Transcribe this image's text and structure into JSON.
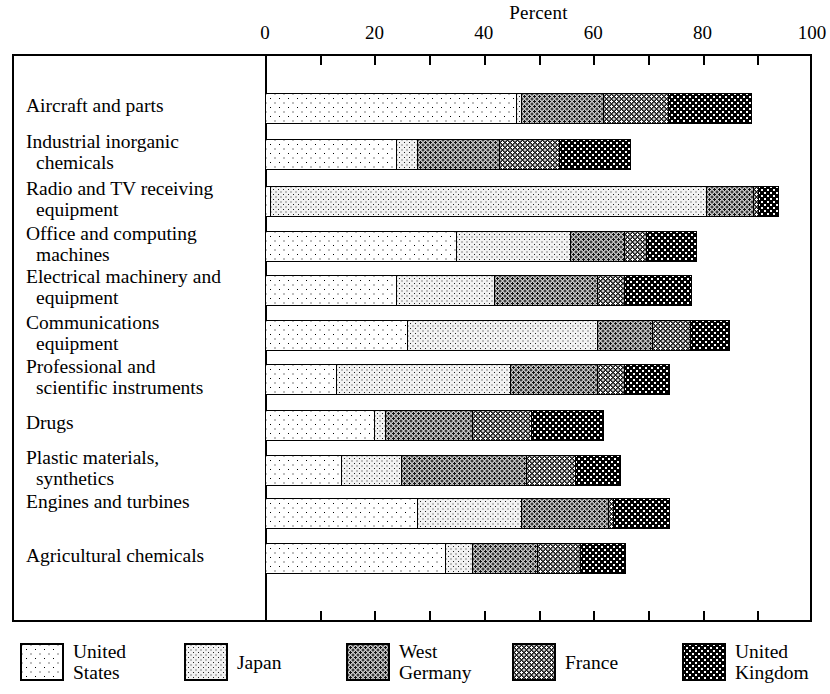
{
  "chart_data": {
    "type": "bar",
    "subtype": "horizontal-stacked",
    "title": "Percent",
    "xlabel": "Percent",
    "ylabel": "",
    "xlim": [
      0,
      100
    ],
    "xticks": [
      0,
      10,
      20,
      30,
      40,
      50,
      60,
      70,
      80,
      90,
      100
    ],
    "xtick_labels": [
      "0",
      "",
      "20",
      "",
      "40",
      "",
      "60",
      "",
      "80",
      "",
      "100"
    ],
    "grid": false,
    "legend_position": "bottom",
    "categories": [
      "Aircraft and parts",
      "Industrial inorganic chemicals",
      "Radio and TV receiving equipment",
      "Office and computing machines",
      "Electrical machinery and equipment",
      "Communications equipment",
      "Professional and scientific instruments",
      "Drugs",
      "Plastic materials, synthetics",
      "Engines and turbines",
      "Agricultural chemicals"
    ],
    "series": [
      {
        "name": "United States",
        "values": [
          46,
          24,
          1,
          35,
          24,
          26,
          13,
          20,
          14,
          28,
          33
        ]
      },
      {
        "name": "Japan",
        "values": [
          1,
          4,
          80,
          21,
          18,
          35,
          32,
          2,
          11,
          19,
          5
        ]
      },
      {
        "name": "West Germany",
        "values": [
          15,
          15,
          8.5,
          10,
          19,
          10,
          16,
          16,
          23,
          16,
          12
        ]
      },
      {
        "name": "France",
        "values": [
          12,
          11,
          1,
          4,
          5,
          7,
          5,
          11,
          9,
          1,
          8
        ]
      },
      {
        "name": "United Kingdom",
        "values": [
          15,
          13,
          3.5,
          9,
          12,
          7,
          8,
          13,
          8,
          10,
          8
        ]
      }
    ],
    "totals": [
      89,
      67,
      94,
      79,
      78,
      85,
      74,
      62,
      65,
      74,
      66
    ]
  },
  "axis": {
    "title": "Percent",
    "tick_labels": [
      "0",
      "20",
      "40",
      "60",
      "80",
      "100"
    ],
    "tick_values": [
      0,
      20,
      40,
      60,
      80,
      100
    ]
  },
  "rows": [
    {
      "line1": "Aircraft and parts",
      "line2": ""
    },
    {
      "line1": "Industrial inorganic",
      "line2": "chemicals"
    },
    {
      "line1": "Radio and TV receiving",
      "line2": "equipment"
    },
    {
      "line1": "Office and computing",
      "line2": "machines"
    },
    {
      "line1": "Electrical machinery and",
      "line2": "equipment"
    },
    {
      "line1": "Communications",
      "line2": "equipment"
    },
    {
      "line1": "Professional and",
      "line2": "scientific instruments"
    },
    {
      "line1": "Drugs",
      "line2": ""
    },
    {
      "line1": "Plastic materials,",
      "line2": "synthetics"
    },
    {
      "line1": "Engines and turbines",
      "line2": ""
    },
    {
      "line1": "Agricultural chemicals",
      "line2": ""
    }
  ],
  "legend": {
    "items": [
      {
        "label": "United\nStates",
        "pattern": "sparse-dots-white",
        "key": "us"
      },
      {
        "label": "Japan",
        "pattern": "fine-dots-light",
        "key": "jp"
      },
      {
        "label": "West\nGermany",
        "pattern": "dots-gray",
        "key": "wg"
      },
      {
        "label": "France",
        "pattern": "checker-dark",
        "key": "fr"
      },
      {
        "label": "United\nKingdom",
        "pattern": "solid-dark-dots",
        "key": "uk"
      }
    ]
  },
  "colors": {
    "united_states": "#ffffff",
    "japan": "#f2f2f2",
    "west_germany": "#c8c8c8",
    "france": "#1a1a1a",
    "united_kingdom": "#000000",
    "ink": "#000000",
    "background": "#ffffff"
  }
}
